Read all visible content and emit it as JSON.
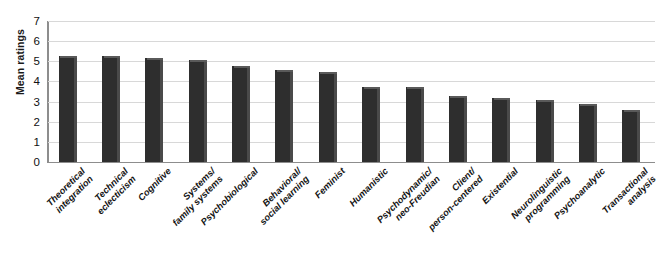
{
  "chart_data": {
    "type": "bar",
    "title": "",
    "xlabel": "",
    "ylabel": "Mean ratings",
    "ylim": [
      0,
      7
    ],
    "yticks": [
      0,
      1,
      2,
      3,
      4,
      5,
      6,
      7
    ],
    "grid": true,
    "legend": false,
    "bar_color": "#2e2e2e",
    "gridline_color": "#d8d8d8",
    "axis_color": "#8d8d8d",
    "categories": [
      "Theoretical integration",
      "Technical eclecticism",
      "Cognitive",
      "Systems/ family systems",
      "Psychobiological",
      "Behavioral/ social learning",
      "Feminist",
      "Humanistic",
      "Psychodynamic/ neo-Freudian",
      "Client/ person-centered",
      "Existential",
      "Neurolinguistic programming",
      "Psychoanalytic",
      "Transactional analysis"
    ],
    "category_lines": [
      [
        "Theoretical",
        "integration"
      ],
      [
        "Technical",
        "eclecticism"
      ],
      [
        "Cognitive"
      ],
      [
        "Systems/",
        "family systems"
      ],
      [
        "Psychobiological"
      ],
      [
        "Behavioral/",
        "social learning"
      ],
      [
        "Feminist"
      ],
      [
        "Humanistic"
      ],
      [
        "Psychodynamic/",
        "neo-Freudian"
      ],
      [
        "Client/",
        "person-centered"
      ],
      [
        "Existential"
      ],
      [
        "Neurolinguistic",
        "programming"
      ],
      [
        "Psychoanalytic"
      ],
      [
        "Transactional",
        "analysis"
      ]
    ],
    "values": [
      5.25,
      5.25,
      5.15,
      5.05,
      4.75,
      4.55,
      4.45,
      3.72,
      3.7,
      3.3,
      3.2,
      3.1,
      2.9,
      2.6
    ]
  }
}
